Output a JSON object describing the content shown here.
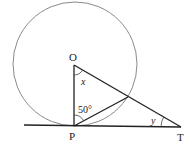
{
  "diagram": {
    "type": "circle-tangent-geometry",
    "points": {
      "O": {
        "label": "O",
        "role": "circle centre"
      },
      "P": {
        "label": "P",
        "role": "point of tangency"
      },
      "T": {
        "label": "T",
        "role": "external point on tangent"
      }
    },
    "angles": {
      "x": {
        "label": "x",
        "at": "O",
        "between": "OP and OT"
      },
      "fifty": {
        "label": "50°",
        "at": "P",
        "between": "PO and chord to circle"
      },
      "y": {
        "label": "y",
        "at": "T",
        "between": "TP and TO"
      }
    },
    "colors": {
      "circle": "#8a8a8a",
      "lines": "#222222",
      "background": "#ffffff"
    }
  }
}
